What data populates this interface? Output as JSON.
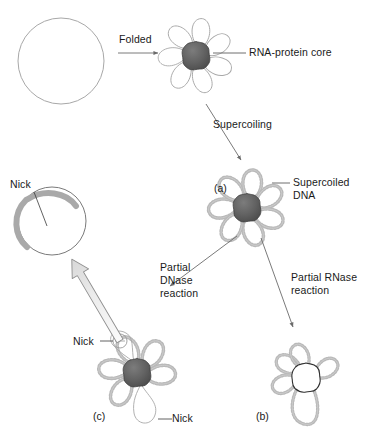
{
  "figure": {
    "background_color": "#ffffff",
    "width": 368,
    "height": 437,
    "colors": {
      "outline": "#9a9a9a",
      "core_dark": "#5c5c5c",
      "core_dark_edge": "#3d3d3d",
      "bead_gray": "#b5b5b5",
      "arc_gray": "#9e9e9e",
      "text": "#1a1a1a",
      "arrow": "#6b6b6b",
      "block_arrow_fill": "#efefef"
    }
  },
  "labels": {
    "folded": "Folded",
    "rna_protein_core": "RNA-protein core",
    "supercoiling": "Supercoiling",
    "supercoiled_dna_line1": "Supercoiled",
    "supercoiled_dna_line2": "DNA",
    "partial_dnase_line1": "Partial",
    "partial_dnase_line2": "DNase",
    "partial_dnase_line3": "reaction",
    "partial_rnase_line1": "Partial RNase",
    "partial_rnase_line2": "reaction",
    "nick_top_left": "Nick",
    "nick_c_upper": "Nick",
    "nick_c_lower": "Nick",
    "panel_a": "(a)",
    "panel_b": "(b)",
    "panel_c": "(c)"
  },
  "structures": [
    {
      "id": "relaxed-circle",
      "name": "relaxed-circular-dna",
      "description": "Large open circle representing relaxed circular chromosome",
      "center": [
        61,
        61
      ],
      "radius": 43
    },
    {
      "id": "folded-rosette",
      "name": "folded-rosette-dna",
      "description": "Rosette of seven smooth DNA loops around a dark RNA-protein core",
      "center": [
        196,
        56
      ],
      "loops": 7,
      "loops_supercoiled": false,
      "core": "dark"
    },
    {
      "id": "supercoiled-rosette-a",
      "name": "supercoiled-rosette-dna",
      "description": "Rosette of supercoiled (beaded) loops around a dark RNA-protein core",
      "center": [
        247,
        208
      ],
      "loops": 7,
      "loops_supercoiled": true,
      "core": "dark"
    },
    {
      "id": "rnase-product-b",
      "name": "rnase-digested-nucleoid",
      "description": "Supercoiled loops with hollow outlined core after partial RNase digestion",
      "center": [
        306,
        378
      ],
      "loops": 6,
      "loops_supercoiled": true,
      "core": "hollow"
    },
    {
      "id": "dnase-product-c",
      "name": "dnase-nicked-nucleoid",
      "description": "Rosette with dark core, some loops supercoiled and two relaxed loops at nick sites",
      "center": [
        137,
        373
      ],
      "loops": 7,
      "loops_supercoiled": true,
      "relaxed_loops": 2,
      "core": "dark"
    },
    {
      "id": "nicked-circle",
      "name": "nicked-relaxed-circle",
      "description": "Open circular DNA with a nick, showing thick gray strand arc",
      "center": [
        52,
        221
      ],
      "radius": 34
    }
  ],
  "connectors": [
    {
      "name": "folded-arrow",
      "from": [
        118,
        52
      ],
      "to": [
        160,
        52
      ],
      "kind": "thin-arrow"
    },
    {
      "name": "supercoiling-arrow",
      "from": [
        205,
        103
      ],
      "to": [
        243,
        163
      ],
      "kind": "thin-arrow"
    },
    {
      "name": "dnase-arrow",
      "from": [
        238,
        236
      ],
      "to": [
        168,
        288
      ],
      "kind": "thin-arrow"
    },
    {
      "name": "rnase-arrow",
      "from": [
        262,
        237
      ],
      "to": [
        294,
        330
      ],
      "kind": "thin-arrow"
    },
    {
      "name": "release-block-arrow",
      "from": [
        120,
        341
      ],
      "to": [
        68,
        254
      ],
      "kind": "block-arrow"
    },
    {
      "name": "rna-protein-core-leader",
      "from": [
        215,
        53
      ],
      "to": [
        245,
        53
      ],
      "kind": "leader"
    },
    {
      "name": "supercoiled-dna-leader",
      "from": [
        272,
        183
      ],
      "to": [
        290,
        183
      ],
      "kind": "leader"
    },
    {
      "name": "nick-top-left-leader",
      "from": [
        34,
        193
      ],
      "to": [
        46,
        224
      ],
      "kind": "leader"
    },
    {
      "name": "nick-c-upper-leader",
      "from": [
        100,
        341
      ],
      "to": [
        116,
        341
      ],
      "kind": "leader"
    },
    {
      "name": "nick-c-lower-leader",
      "from": [
        160,
        419
      ],
      "to": [
        172,
        419
      ],
      "kind": "leader"
    }
  ]
}
